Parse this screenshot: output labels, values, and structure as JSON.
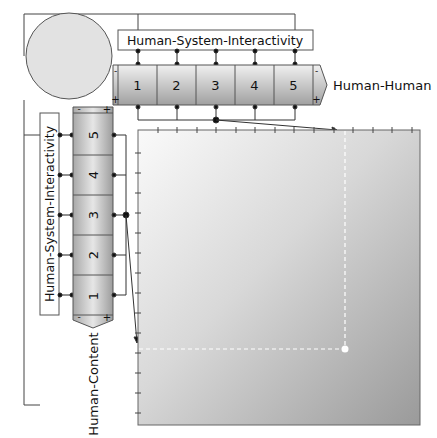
{
  "diagram": {
    "top_axis_label": "Human-System-Interactivity",
    "left_axis_label": "Human-System-Interactivity",
    "horizontal_scale": {
      "name": "Human-Human",
      "cells": [
        "1",
        "2",
        "3",
        "4",
        "5"
      ],
      "minus": "-",
      "plus": "+"
    },
    "vertical_scale": {
      "name": "Human-Content",
      "cells": [
        "1",
        "2",
        "3",
        "4",
        "5"
      ],
      "minus": "-",
      "plus": "+"
    },
    "selected_point": {
      "x_value": 3,
      "y_value": 3
    },
    "colors": {
      "bar_light": "#eeeeee",
      "bar_dark": "#9a9a9a",
      "circle_fill": "#e2e2e2",
      "chart_light": "#f6f6f6",
      "chart_dark": "#9e9e9e",
      "line": "#333333",
      "marker": "#ffffff"
    }
  }
}
